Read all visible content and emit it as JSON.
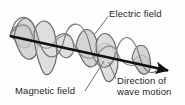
{
  "diagram": {
    "title_absent": true,
    "type": "electromagnetic-wave",
    "labels": {
      "electric_field": "Electric field",
      "magnetic_field": "Magnetic field",
      "direction_line1": "Direction of",
      "direction_line2": "wave motion"
    },
    "colors": {
      "background": "#fdfdfd",
      "axis": "#111111",
      "wave_stroke": "#6b6b6b",
      "wave_fill_light": "#e2e2e2",
      "wave_fill_dark": "#b9b9b9",
      "text": "#1e1e1e",
      "leader_line": "#6f6f6f"
    },
    "axis": {
      "start_x": 10,
      "start_y": 36,
      "end_x": 170,
      "end_y": 71,
      "arrow": "arrowhead-right",
      "meaning": "direction of wave motion"
    },
    "waves": [
      {
        "name": "electric-field-wave",
        "plane": "vertical",
        "cycles": 3,
        "amplitude_start": 22,
        "amplitude_end": 13
      },
      {
        "name": "magnetic-field-wave",
        "plane": "perpendicular-oblique",
        "cycles": 3,
        "amplitude_start": 22,
        "amplitude_end": 13
      }
    ],
    "leaders": [
      {
        "name": "electric-field-leader",
        "x1": 108,
        "y1": 16,
        "x2": 95,
        "y2": 34
      },
      {
        "name": "magnetic-field-leader",
        "x1": 85,
        "y1": 91,
        "x2": 104,
        "y2": 61
      },
      {
        "name": "direction-leader",
        "x1": 116,
        "y1": 78,
        "x2": 108,
        "y2": 62
      }
    ]
  }
}
